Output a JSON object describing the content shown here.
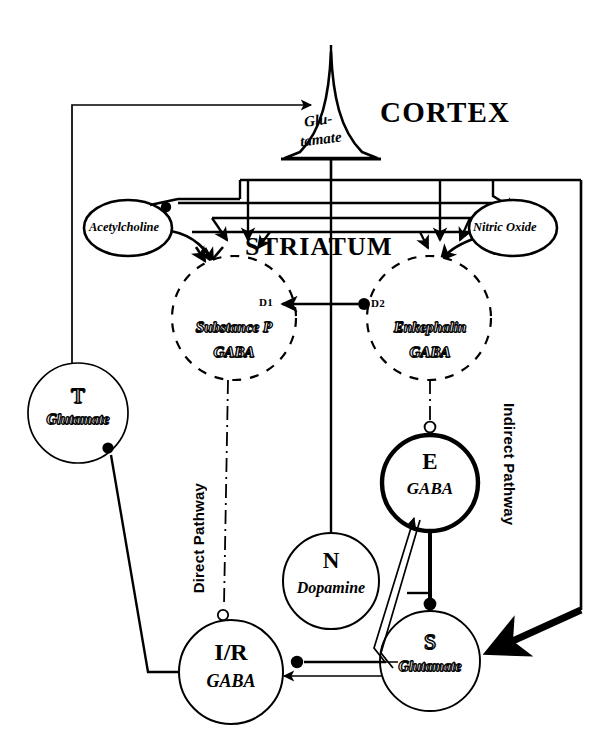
{
  "figure": {
    "background": "#ffffff",
    "ink": "#000000"
  },
  "regions": {
    "cortex_label": "CORTEX",
    "striatum_label": "STRIATUM"
  },
  "pathways": {
    "direct": "Direct Pathway",
    "indirect": "Indirect Pathway"
  },
  "receptors": {
    "d1": "D1",
    "d2": "D2"
  },
  "nodes": {
    "cortex_pyramid": {
      "transmitter_line1": "Glu-",
      "transmitter_line2": "tamate"
    },
    "acetylcholine": {
      "label": "Acetylcholine"
    },
    "nitric_oxide": {
      "label": "Nitric Oxide"
    },
    "substance_p": {
      "line1": "Substance  P",
      "line2": "GABA"
    },
    "enkephalin": {
      "line1": "Enkephalin",
      "line2": "GABA"
    },
    "thalamus": {
      "letter": "T",
      "transmitter": "Glutamate"
    },
    "external_pallidum": {
      "letter": "E",
      "transmitter": "GABA"
    },
    "substantia_nigra": {
      "letter": "N",
      "transmitter": "Dopamine"
    },
    "subthalamic": {
      "letter": "S",
      "transmitter": "Glutamate"
    },
    "internal_pallidum": {
      "letter": "I/R",
      "transmitter": "GABA"
    }
  }
}
